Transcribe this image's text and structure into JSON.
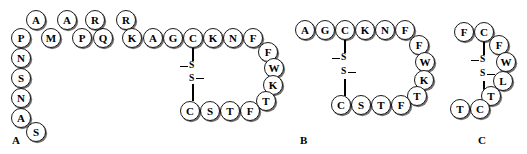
{
  "figure": {
    "width": 527,
    "height": 154,
    "background": "#ffffff",
    "residue_fill": "#ffffff",
    "residue_stroke": "#1a1a1a",
    "bond_color": "#000000"
  },
  "panels": [
    {
      "id": "panel-a",
      "label": "A",
      "label_x": 12,
      "label_y": 135,
      "sequence": "PAMAPRQRKAGCKNFFWKTFTSCGASNSNP",
      "disulfide": {
        "label_top": "S",
        "label_bottom": "S",
        "residue_top": "C",
        "residue_bottom": "C"
      },
      "residues": [
        {
          "letter": "P",
          "x": 11,
          "y": 28
        },
        {
          "letter": "A",
          "x": 26,
          "y": 10
        },
        {
          "letter": "M",
          "x": 41,
          "y": 28
        },
        {
          "letter": "A",
          "x": 57,
          "y": 10
        },
        {
          "letter": "P",
          "x": 72,
          "y": 28
        },
        {
          "letter": "Q",
          "x": 93,
          "y": 28
        },
        {
          "letter": "R",
          "x": 85,
          "y": 10
        },
        {
          "letter": "R",
          "x": 116,
          "y": 10
        },
        {
          "letter": "K",
          "x": 122,
          "y": 28
        },
        {
          "letter": "A",
          "x": 143,
          "y": 28
        },
        {
          "letter": "G",
          "x": 163,
          "y": 28
        },
        {
          "letter": "C",
          "x": 183,
          "y": 28
        },
        {
          "letter": "K",
          "x": 203,
          "y": 28
        },
        {
          "letter": "N",
          "x": 223,
          "y": 28
        },
        {
          "letter": "F",
          "x": 243,
          "y": 28
        },
        {
          "letter": "F",
          "x": 258,
          "y": 42
        },
        {
          "letter": "W",
          "x": 264,
          "y": 58
        },
        {
          "letter": "K",
          "x": 263,
          "y": 75
        },
        {
          "letter": "T",
          "x": 256,
          "y": 91
        },
        {
          "letter": "F",
          "x": 240,
          "y": 101
        },
        {
          "letter": "T",
          "x": 220,
          "y": 101
        },
        {
          "letter": "S",
          "x": 200,
          "y": 101
        },
        {
          "letter": "C",
          "x": 180,
          "y": 101
        },
        {
          "letter": "N",
          "x": 11,
          "y": 48
        },
        {
          "letter": "S",
          "x": 11,
          "y": 68
        },
        {
          "letter": "N",
          "x": 11,
          "y": 88
        },
        {
          "letter": "A",
          "x": 11,
          "y": 108
        },
        {
          "letter": "S",
          "x": 26,
          "y": 122
        }
      ],
      "bonds": [
        {
          "x": 192,
          "y": 48,
          "h": 14
        },
        {
          "x": 192,
          "y": 84,
          "h": 17
        }
      ],
      "ss_marks": [
        {
          "type": "label",
          "text": "S",
          "x": 188,
          "y": 61
        },
        {
          "type": "dash",
          "x": 180,
          "y": 66,
          "w": 8
        },
        {
          "type": "dash",
          "x": 196,
          "y": 78,
          "w": 8
        },
        {
          "type": "label",
          "text": "S",
          "x": 188,
          "y": 74
        }
      ]
    },
    {
      "id": "panel-b",
      "label": "B",
      "label_x": 300,
      "label_y": 135,
      "sequence": "AGCKNFFWKTFTSCG",
      "disulfide": {
        "label_top": "S",
        "label_bottom": "S",
        "residue_top": "C",
        "residue_bottom": "C"
      },
      "residues": [
        {
          "letter": "A",
          "x": 295,
          "y": 20
        },
        {
          "letter": "G",
          "x": 315,
          "y": 20
        },
        {
          "letter": "C",
          "x": 335,
          "y": 20
        },
        {
          "letter": "K",
          "x": 355,
          "y": 20
        },
        {
          "letter": "N",
          "x": 375,
          "y": 20
        },
        {
          "letter": "F",
          "x": 395,
          "y": 20
        },
        {
          "letter": "F",
          "x": 409,
          "y": 35
        },
        {
          "letter": "W",
          "x": 415,
          "y": 52
        },
        {
          "letter": "K",
          "x": 414,
          "y": 70
        },
        {
          "letter": "T",
          "x": 407,
          "y": 86
        },
        {
          "letter": "F",
          "x": 391,
          "y": 95
        },
        {
          "letter": "T",
          "x": 371,
          "y": 95
        },
        {
          "letter": "S",
          "x": 351,
          "y": 95
        },
        {
          "letter": "C",
          "x": 331,
          "y": 95
        }
      ],
      "bonds": [
        {
          "x": 344,
          "y": 40,
          "h": 13
        },
        {
          "x": 344,
          "y": 79,
          "h": 17
        }
      ],
      "ss_marks": [
        {
          "type": "label",
          "text": "S",
          "x": 340,
          "y": 53
        },
        {
          "type": "dash",
          "x": 332,
          "y": 58,
          "w": 8
        },
        {
          "type": "dash",
          "x": 348,
          "y": 72,
          "w": 8
        },
        {
          "type": "label",
          "text": "S",
          "x": 340,
          "y": 67
        }
      ]
    },
    {
      "id": "panel-c",
      "label": "C",
      "label_x": 478,
      "label_y": 135,
      "sequence": "FCFWLTCT",
      "disulfide": {
        "label_top": "S",
        "label_bottom": "S",
        "residue_top": "C",
        "residue_bottom": "C"
      },
      "residues": [
        {
          "letter": "F",
          "x": 454,
          "y": 22
        },
        {
          "letter": "C",
          "x": 474,
          "y": 22
        },
        {
          "letter": "F",
          "x": 489,
          "y": 35
        },
        {
          "letter": "W",
          "x": 496,
          "y": 52
        },
        {
          "letter": "L",
          "x": 493,
          "y": 71
        },
        {
          "letter": "T",
          "x": 481,
          "y": 86
        },
        {
          "letter": "C",
          "x": 470,
          "y": 99
        },
        {
          "letter": "T",
          "x": 450,
          "y": 99
        }
      ],
      "bonds": [
        {
          "x": 483,
          "y": 42,
          "h": 13
        },
        {
          "x": 483,
          "y": 81,
          "h": 19
        }
      ],
      "ss_marks": [
        {
          "type": "label",
          "text": "S",
          "x": 479,
          "y": 55
        },
        {
          "type": "dash",
          "x": 471,
          "y": 60,
          "w": 8
        },
        {
          "type": "dash",
          "x": 487,
          "y": 74,
          "w": 8
        },
        {
          "type": "label",
          "text": "S",
          "x": 479,
          "y": 69
        }
      ]
    }
  ]
}
